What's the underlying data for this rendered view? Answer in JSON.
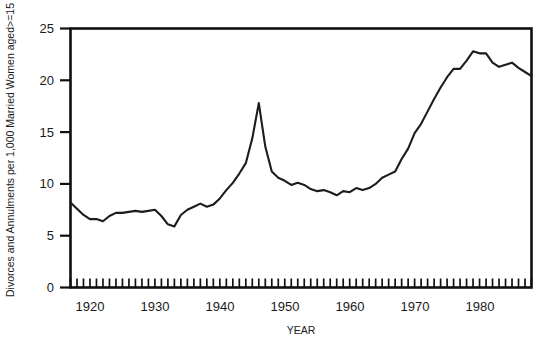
{
  "figure": {
    "background_color": "#ffffff",
    "line_color": "#1c1c1c",
    "axis_color": "#101010"
  },
  "labels": {
    "ylabel": "Divorces and Annulments per 1,000 Married Women aged>=15",
    "xlabel": "YEAR",
    "ytick_0": "0",
    "ytick_5": "5",
    "ytick_10": "10",
    "ytick_15": "15",
    "ytick_20": "20",
    "ytick_25": "25",
    "xtick_1920": "1920",
    "xtick_1930": "1930",
    "xtick_1940": "1940",
    "xtick_1950": "1950",
    "xtick_1960": "1960",
    "xtick_1970": "1970",
    "xtick_1980": "1980"
  },
  "chart_data": {
    "type": "line",
    "title": "",
    "subtitle": "",
    "xlabel": "YEAR",
    "ylabel": "Divorces and Annulments per 1,000 Married Women aged>=15",
    "xlim": [
      1917,
      1988
    ],
    "ylim": [
      0,
      25
    ],
    "ytick_values": [
      0,
      5,
      10,
      15,
      20,
      25
    ],
    "xtick_values": [
      1920,
      1930,
      1940,
      1950,
      1960,
      1970,
      1980
    ],
    "xtick_minor_interval": 1,
    "grid": false,
    "legend": false,
    "legend_position": "none",
    "annotations": [],
    "series": [
      {
        "name": "Divorce rate",
        "x": [
          1917,
          1918,
          1919,
          1920,
          1921,
          1922,
          1923,
          1924,
          1925,
          1926,
          1927,
          1928,
          1929,
          1930,
          1931,
          1932,
          1933,
          1934,
          1935,
          1936,
          1937,
          1938,
          1939,
          1940,
          1941,
          1942,
          1943,
          1944,
          1945,
          1946,
          1947,
          1948,
          1949,
          1950,
          1951,
          1952,
          1953,
          1954,
          1955,
          1956,
          1957,
          1958,
          1959,
          1960,
          1961,
          1962,
          1963,
          1964,
          1965,
          1966,
          1967,
          1968,
          1969,
          1970,
          1971,
          1972,
          1973,
          1974,
          1975,
          1976,
          1977,
          1978,
          1979,
          1980,
          1981,
          1982,
          1983,
          1984,
          1985,
          1986,
          1987,
          1988
        ],
        "y": [
          8.2,
          7.6,
          7.0,
          6.6,
          6.6,
          6.4,
          6.9,
          7.2,
          7.2,
          7.3,
          7.4,
          7.3,
          7.4,
          7.5,
          6.9,
          6.1,
          5.9,
          7.0,
          7.5,
          7.8,
          8.1,
          7.8,
          8.0,
          8.6,
          9.4,
          10.1,
          11.0,
          12.0,
          14.4,
          17.8,
          13.6,
          11.2,
          10.6,
          10.3,
          9.9,
          10.1,
          9.9,
          9.5,
          9.3,
          9.4,
          9.2,
          8.9,
          9.3,
          9.2,
          9.6,
          9.4,
          9.6,
          10.0,
          10.6,
          10.9,
          11.2,
          12.4,
          13.4,
          14.9,
          15.8,
          17.0,
          18.2,
          19.3,
          20.3,
          21.1,
          21.1,
          21.9,
          22.8,
          22.6,
          22.6,
          21.7,
          21.3,
          21.5,
          21.7,
          21.2,
          20.8,
          20.4
        ]
      }
    ]
  }
}
